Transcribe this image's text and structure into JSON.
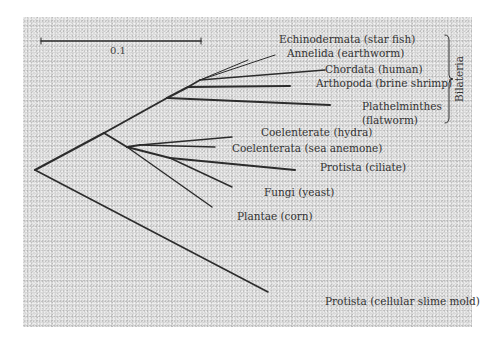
{
  "figure": {
    "type": "phylogenetic-tree",
    "background": "#cbcbcb",
    "line_color": "#2c2c2c"
  },
  "scale_bar": {
    "label": "0.1",
    "x1": 41,
    "x2": 201,
    "y": 41,
    "label_x": 118,
    "label_y": 54
  },
  "clade_bracket": {
    "label": "Bilateria",
    "x": 449,
    "y1": 35,
    "y2": 123,
    "label_x": 460,
    "label_y": 79
  },
  "nodes": {
    "root": [
      35,
      170
    ],
    "n_main": [
      104,
      133
    ],
    "n_bilateria": [
      167,
      98
    ],
    "n_b2": [
      188,
      87
    ],
    "n_b3": [
      200,
      80
    ],
    "n_lower": [
      127,
      147
    ],
    "n_coel": [
      140,
      145
    ],
    "n_protista_fungi": [
      170,
      158
    ]
  },
  "edges": [
    {
      "from": [
        35,
        170
      ],
      "to": [
        104,
        133
      ],
      "w": 2
    },
    {
      "from": [
        35,
        170
      ],
      "to": [
        268,
        292
      ],
      "w": 1.6
    },
    {
      "from": [
        104,
        133
      ],
      "to": [
        167,
        98
      ],
      "w": 2
    },
    {
      "from": [
        104,
        133
      ],
      "to": [
        127,
        147
      ],
      "w": 2
    },
    {
      "from": [
        167,
        98
      ],
      "to": [
        188,
        87
      ],
      "w": 2
    },
    {
      "from": [
        167,
        98
      ],
      "to": [
        330,
        105
      ],
      "w": 2
    },
    {
      "from": [
        188,
        87
      ],
      "to": [
        200,
        80
      ],
      "w": 1.6
    },
    {
      "from": [
        188,
        87
      ],
      "to": [
        290,
        86
      ],
      "w": 2
    },
    {
      "from": [
        200,
        80
      ],
      "to": [
        325,
        70
      ],
      "w": 1.3
    },
    {
      "from": [
        200,
        80
      ],
      "to": [
        248,
        60
      ],
      "w": 1
    },
    {
      "from": [
        200,
        80
      ],
      "to": [
        275,
        55
      ],
      "w": 1
    },
    {
      "from": [
        127,
        147
      ],
      "to": [
        140,
        145
      ],
      "w": 2
    },
    {
      "from": [
        140,
        145
      ],
      "to": [
        232,
        137
      ],
      "w": 1.4
    },
    {
      "from": [
        140,
        145
      ],
      "to": [
        215,
        147
      ],
      "w": 1.4
    },
    {
      "from": [
        127,
        147
      ],
      "to": [
        170,
        158
      ],
      "w": 2
    },
    {
      "from": [
        170,
        158
      ],
      "to": [
        295,
        170
      ],
      "w": 2
    },
    {
      "from": [
        170,
        158
      ],
      "to": [
        232,
        187
      ],
      "w": 1.4
    },
    {
      "from": [
        127,
        147
      ],
      "to": [
        212,
        207
      ],
      "w": 1.4
    }
  ],
  "taxa": [
    {
      "label": "Echinodermata (star fish)",
      "x": 279,
      "y": 43
    },
    {
      "label": "Annelida (earthworm)",
      "x": 287,
      "y": 57
    },
    {
      "label": "Chordata (human)",
      "x": 325,
      "y": 73
    },
    {
      "label": "Arthopoda  (brine shrimp)",
      "x": 316,
      "y": 87
    },
    {
      "label": "Plathelminthes",
      "x": 362,
      "y": 110
    },
    {
      "label": "(flatworm)",
      "x": 362,
      "y": 124
    },
    {
      "label": "Coelenterate (hydra)",
      "x": 261,
      "y": 136
    },
    {
      "label": "Coelenterata (sea anemone)",
      "x": 232,
      "y": 152
    },
    {
      "label": "Protista (ciliate)",
      "x": 320,
      "y": 171
    },
    {
      "label": "Fungi (yeast)",
      "x": 264,
      "y": 196
    },
    {
      "label": "Plantae (corn)",
      "x": 237,
      "y": 220
    },
    {
      "label": "Protista (cellular slime mold)",
      "x": 325,
      "y": 305
    }
  ]
}
